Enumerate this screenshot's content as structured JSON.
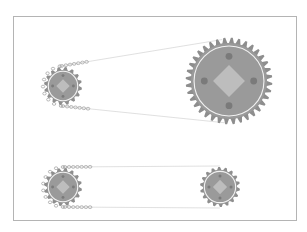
{
  "diagram": {
    "title": "",
    "colors": {
      "frame": "#b4b4b4",
      "gear_body": "#9a9a9a",
      "gear_teeth": "#8e8e8e",
      "pitch_circle": "#f2f2f2",
      "hub_diamond": "#bdbdbd",
      "bolt_holes": "#7a7a7a",
      "chain_link": "#9c9c9c",
      "chain_line": "#d8d8d8"
    },
    "drives": [
      {
        "name": "top-drive",
        "driver": {
          "cx": 63,
          "cy": 86,
          "r": 16,
          "teeth": 16
        },
        "driven": {
          "cx": 229,
          "cy": 81,
          "r": 38,
          "teeth": 36
        },
        "chain": {
          "upper_link_label": "oo oo oo",
          "lower_link_label": "oo oo oo"
        }
      },
      {
        "name": "bottom-drive",
        "driver": {
          "cx": 63,
          "cy": 187,
          "r": 16,
          "teeth": 16
        },
        "driven": {
          "cx": 220,
          "cy": 187,
          "r": 17,
          "teeth": 18
        },
        "chain": {
          "upper_link_label": "oo oo oo",
          "lower_link_label": "oo oo oo"
        }
      }
    ]
  }
}
